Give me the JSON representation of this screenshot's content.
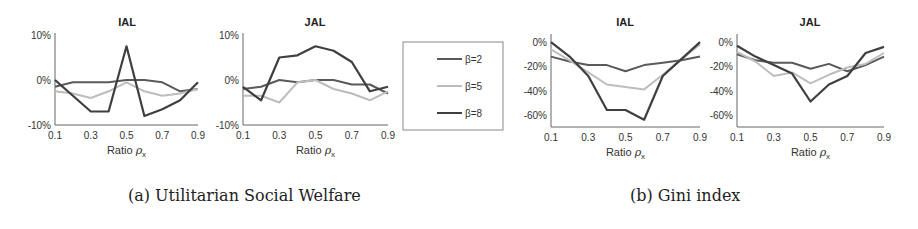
{
  "figure": {
    "captions": {
      "a": "(a) Utilitarian Social Welfare",
      "b": "(b) Gini index"
    },
    "legend": {
      "entries": [
        {
          "label": "β=2",
          "color": "#555555"
        },
        {
          "label": "β=5",
          "color": "#bbbbbb"
        },
        {
          "label": "β=8",
          "color": "#444444"
        }
      ]
    },
    "xlabel": "Ratio ρx"
  },
  "chart_data": [
    {
      "type": "line",
      "panel": "a",
      "title": "IAL",
      "xlabel": "Ratio ρx",
      "ylabel": "",
      "x": [
        0.1,
        0.2,
        0.3,
        0.4,
        0.5,
        0.6,
        0.7,
        0.8,
        0.9
      ],
      "xticks": [
        "0.1",
        "0.3",
        "0.5",
        "0.7",
        "0.9"
      ],
      "yticks": [
        "10%",
        "0%",
        "-10%"
      ],
      "ylim": [
        -10,
        10
      ],
      "series": [
        {
          "name": "β=2",
          "values": [
            -1.5,
            -0.5,
            -0.5,
            -0.5,
            0,
            0,
            -0.5,
            -2.5,
            -2
          ]
        },
        {
          "name": "β=5",
          "values": [
            -2.5,
            -3,
            -4,
            -2.5,
            -0.5,
            -2.5,
            -3.5,
            -3,
            -2
          ]
        },
        {
          "name": "β=8",
          "values": [
            0,
            -3.5,
            -7,
            -7,
            7.5,
            -8,
            -6.5,
            -4.5,
            -0.5
          ]
        }
      ]
    },
    {
      "type": "line",
      "panel": "a",
      "title": "JAL",
      "xlabel": "Ratio ρx",
      "ylabel": "",
      "x": [
        0.1,
        0.2,
        0.3,
        0.4,
        0.5,
        0.6,
        0.7,
        0.8,
        0.9
      ],
      "xticks": [
        "0.1",
        "0.3",
        "0.5",
        "0.7",
        "0.9"
      ],
      "yticks": [
        "10%",
        "0%",
        "-10%"
      ],
      "ylim": [
        -10,
        10
      ],
      "series": [
        {
          "name": "β=2",
          "values": [
            -2,
            -1.5,
            0,
            -0.5,
            0,
            0,
            -1,
            -1,
            -3
          ]
        },
        {
          "name": "β=5",
          "values": [
            -3.5,
            -3.5,
            -5,
            -0.5,
            0,
            -2,
            -3,
            -4.5,
            -2.5
          ]
        },
        {
          "name": "β=8",
          "values": [
            -1.5,
            -4.5,
            5,
            5.5,
            7.5,
            6.5,
            4,
            -2.5,
            -1.5
          ]
        }
      ]
    },
    {
      "type": "line",
      "panel": "b",
      "title": "IAL",
      "xlabel": "Ratio ρx",
      "ylabel": "",
      "x": [
        0.1,
        0.2,
        0.3,
        0.4,
        0.5,
        0.6,
        0.7,
        0.8,
        0.9
      ],
      "xticks": [
        "0.1",
        "0.3",
        "0.5",
        "0.7",
        "0.9"
      ],
      "yticks": [
        "0%",
        "-20%",
        "-40%",
        "-60%"
      ],
      "ylim": [
        -70,
        5
      ],
      "series": [
        {
          "name": "β=2",
          "values": [
            -12,
            -16,
            -19,
            -19,
            -24,
            -19,
            -17,
            -15,
            -12
          ]
        },
        {
          "name": "β=5",
          "values": [
            -6,
            -15,
            -25,
            -35,
            -37,
            -39,
            -27,
            -14,
            -2
          ]
        },
        {
          "name": "β=8",
          "values": [
            0,
            -12,
            -28,
            -56,
            -56,
            -64,
            -28,
            -14,
            0
          ]
        }
      ]
    },
    {
      "type": "line",
      "panel": "b",
      "title": "JAL",
      "xlabel": "Ratio ρx",
      "ylabel": "",
      "x": [
        0.1,
        0.2,
        0.3,
        0.4,
        0.5,
        0.6,
        0.7,
        0.8,
        0.9
      ],
      "xticks": [
        "0.1",
        "0.3",
        "0.5",
        "0.7",
        "0.9"
      ],
      "yticks": [
        "0%",
        "-20%",
        "-40%",
        "-60%"
      ],
      "ylim": [
        -70,
        5
      ],
      "series": [
        {
          "name": "β=2",
          "values": [
            -10,
            -15,
            -17,
            -17,
            -22,
            -18,
            -24,
            -19,
            -12
          ]
        },
        {
          "name": "β=5",
          "values": [
            -8,
            -16,
            -28,
            -25,
            -34,
            -27,
            -21,
            -18,
            -9
          ]
        },
        {
          "name": "β=8",
          "values": [
            -3,
            -12,
            -19,
            -26,
            -49,
            -35,
            -28,
            -9,
            -4
          ]
        }
      ]
    }
  ]
}
